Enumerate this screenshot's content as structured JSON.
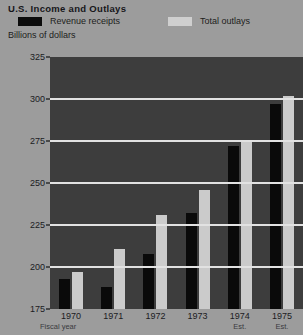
{
  "title": "U.S. Income and Outlays",
  "units_label": "Billions of dollars",
  "legend": {
    "revenue_label": "Revenue receipts",
    "outlays_label": "Total outlays",
    "revenue_color": "#0a0a0a",
    "outlays_color": "#cbcbcb"
  },
  "axis": {
    "x_title": "Fiscal year",
    "estimate_note": "Est."
  },
  "chart_data": {
    "type": "bar",
    "title": "U.S. Income and Outlays",
    "xlabel": "Fiscal year",
    "ylabel": "Billions of dollars",
    "ylim": [
      175,
      325
    ],
    "yticks": [
      175,
      200,
      225,
      250,
      275,
      300,
      325
    ],
    "grid": true,
    "legend_position": "top",
    "categories": [
      "1970",
      "1971",
      "1972",
      "1973",
      "1974",
      "1975"
    ],
    "category_notes": [
      "",
      "",
      "",
      "",
      "Est.",
      "Est."
    ],
    "series": [
      {
        "name": "Revenue receipts",
        "color": "#0a0a0a",
        "values": [
          193,
          188,
          208,
          232,
          272,
          297
        ]
      },
      {
        "name": "Total outlays",
        "color": "#cbcbcb",
        "values": [
          197,
          211,
          231,
          246,
          275,
          302
        ]
      }
    ]
  }
}
